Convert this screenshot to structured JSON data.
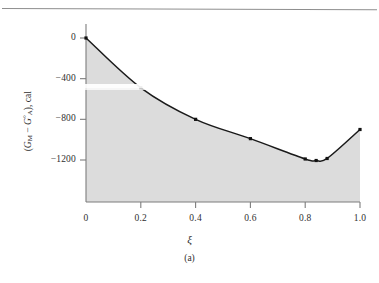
{
  "figure": {
    "caption": "(a)",
    "x_axis_title": "ξ",
    "y_axis_title_parts": {
      "open": "(",
      "g_m": "G",
      "g_m_sub": "M",
      "minus": " − ",
      "g_a": "G",
      "g_a_sup": "°",
      "g_a_sub": "A",
      "close": "), cal"
    },
    "y_axis_title_plain": "(G_M − G°_A), cal"
  },
  "chart_data": {
    "type": "line",
    "title": "",
    "subtitle": "",
    "xlabel": "ξ",
    "ylabel": "(G_M − G°_A), cal",
    "xlim": [
      0,
      1.0
    ],
    "ylim": [
      -1400,
      100
    ],
    "grid": false,
    "legend": false,
    "area_fill": true,
    "area_fill_color": "#dcdcdc",
    "line_color": "#1a1a1a",
    "marker_color": "#111111",
    "marker_shape": "square",
    "xticks": [
      0,
      0.2,
      0.4,
      0.6,
      0.8,
      1.0
    ],
    "xtick_labels": [
      "0",
      "0.2",
      "0.4",
      "0.6",
      "0.8",
      "1.0"
    ],
    "yticks": [
      0,
      -400,
      -800,
      -1200
    ],
    "ytick_labels": [
      "0",
      "−400",
      "−800",
      "−1200"
    ],
    "series": [
      {
        "name": "Gibbs energy of mixing",
        "x": [
          0,
          0.2,
          0.4,
          0.6,
          0.8,
          0.84,
          0.88,
          1.0
        ],
        "values": [
          0,
          -490,
          -800,
          -990,
          -1190,
          -1205,
          -1185,
          -900
        ]
      }
    ],
    "points": [
      {
        "x": 0,
        "y": 0
      },
      {
        "x": 0.2,
        "y": -490
      },
      {
        "x": 0.4,
        "y": -800
      },
      {
        "x": 0.6,
        "y": -990
      },
      {
        "x": 0.8,
        "y": -1190
      },
      {
        "x": 0.84,
        "y": -1205
      },
      {
        "x": 0.88,
        "y": -1185
      },
      {
        "x": 1.0,
        "y": -900
      }
    ]
  },
  "geometry": {
    "x0_px": 86,
    "x1_px": 360,
    "y0_px": 38,
    "y1200_px": 160,
    "baseline_px": 202
  }
}
